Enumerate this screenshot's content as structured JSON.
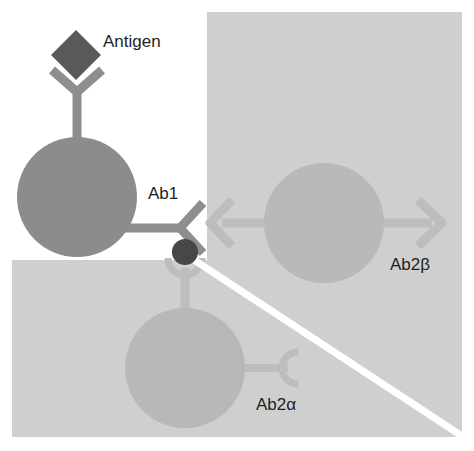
{
  "diagram": {
    "type": "idiotype-network",
    "labels": {
      "antigen": "Antigen",
      "ab1": "Ab1",
      "ab2beta": "Ab2β",
      "ab2alpha": "Ab2α"
    },
    "colors": {
      "background": "#ffffff",
      "panel_gray": "#cfcfcf",
      "ab1_cell": "#8c8c8c",
      "ab1_antibody": "#8e8e8e",
      "antigen": "#5a5a5a",
      "idiotope": "#474747",
      "ab2_cell": "#b8b8b8",
      "ab2_antibody": "#bdbdbd",
      "divider": "#ffffff",
      "text": "#1e1e1e"
    },
    "elements": [
      {
        "name": "antigen",
        "shape": "diamond"
      },
      {
        "name": "ab1-cell",
        "shape": "circle",
        "label": "Ab1"
      },
      {
        "name": "ab2beta-cell",
        "shape": "circle",
        "label": "Ab2β"
      },
      {
        "name": "ab2alpha-cell",
        "shape": "circle",
        "label": "Ab2α"
      }
    ]
  }
}
